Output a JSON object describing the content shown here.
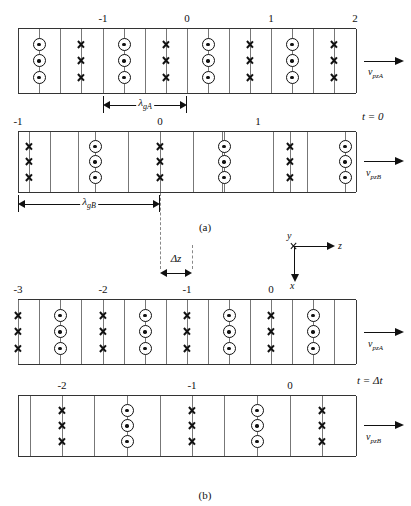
{
  "figure": {
    "title_a": "(a)",
    "title_b": "(b)",
    "caption_a_x": 205,
    "caption_a_y": 221,
    "caption_b_x": 205,
    "caption_b_y": 489
  },
  "axes_triad": {
    "y_label": "y",
    "z_label": "z",
    "x_label": "x",
    "origin_symbol": "cross"
  },
  "panels": [
    {
      "id": "panel-a-top",
      "name": "guide-A-t0",
      "left": 18,
      "top": 28,
      "width": 338,
      "height": 66,
      "tick_labels": [
        {
          "text": "-1",
          "x": 103
        },
        {
          "text": "0",
          "x": 187
        },
        {
          "text": "1",
          "x": 271
        },
        {
          "text": "2",
          "x": 355
        }
      ],
      "boundaries": [
        18,
        60,
        103,
        145,
        187,
        229,
        271,
        313,
        356
      ],
      "symbol_columns": [
        {
          "x": 39,
          "type": "dot"
        },
        {
          "x": 81,
          "type": "cross"
        },
        {
          "x": 124,
          "type": "dot"
        },
        {
          "x": 166,
          "type": "cross"
        },
        {
          "x": 208,
          "type": "dot"
        },
        {
          "x": 250,
          "type": "cross"
        },
        {
          "x": 292,
          "type": "dot"
        },
        {
          "x": 334,
          "type": "cross"
        }
      ],
      "velocity": {
        "label_v": "v",
        "label_sub": "pzA",
        "arrow_x": 364,
        "arrow_y": 56,
        "label_x": 368,
        "label_y": 66
      },
      "measure": {
        "label": "λ",
        "label_sub": "gA",
        "left": 103,
        "right": 187,
        "y": 100,
        "label_x": 145
      }
    },
    {
      "id": "panel-a-bottom",
      "name": "guide-B-t0",
      "left": 18,
      "top": 131,
      "width": 338,
      "height": 62,
      "tick_labels": [
        {
          "text": "-1",
          "x": 18
        },
        {
          "text": "0",
          "x": 160
        },
        {
          "text": "1",
          "x": 258
        }
      ],
      "boundaries": [
        18,
        50,
        78,
        128,
        160,
        193,
        222,
        273,
        307,
        356
      ],
      "symbol_columns": [
        {
          "x": 29,
          "type": "cross"
        },
        {
          "x": 95,
          "type": "dot"
        },
        {
          "x": 160,
          "type": "cross"
        },
        {
          "x": 224,
          "type": "dot"
        },
        {
          "x": 290,
          "type": "cross"
        },
        {
          "x": 345,
          "type": "dot"
        }
      ],
      "velocity": {
        "label_v": "v",
        "label_sub": "pzB",
        "arrow_x": 364,
        "arrow_y": 156,
        "label_x": 366,
        "label_y": 167
      },
      "time_label": {
        "text": "t = 0",
        "x": 362,
        "y": 110
      },
      "measure": {
        "label": "λ",
        "label_sub": "gB",
        "left": 18,
        "right": 160,
        "y": 199,
        "label_x": 89
      }
    },
    {
      "id": "panel-b-top",
      "name": "guide-A-tdt",
      "left": 18,
      "top": 299,
      "width": 338,
      "height": 66,
      "tick_labels": [
        {
          "text": "-3",
          "x": 18
        },
        {
          "text": "-2",
          "x": 103
        },
        {
          "text": "-1",
          "x": 187
        },
        {
          "text": "0",
          "x": 271
        }
      ],
      "boundaries": [
        18,
        39,
        81,
        124,
        166,
        208,
        250,
        292,
        334,
        356
      ],
      "symbol_columns": [
        {
          "x": 18,
          "type": "cross"
        },
        {
          "x": 60,
          "type": "dot"
        },
        {
          "x": 103,
          "type": "cross"
        },
        {
          "x": 145,
          "type": "dot"
        },
        {
          "x": 187,
          "type": "cross"
        },
        {
          "x": 229,
          "type": "dot"
        },
        {
          "x": 271,
          "type": "cross"
        },
        {
          "x": 313,
          "type": "dot"
        }
      ],
      "velocity": {
        "label_v": "v",
        "label_sub": "pzA",
        "arrow_x": 364,
        "arrow_y": 327,
        "label_x": 368,
        "label_y": 338
      }
    },
    {
      "id": "panel-b-bottom",
      "name": "guide-B-tdt",
      "left": 18,
      "top": 395,
      "width": 338,
      "height": 62,
      "tick_labels": [
        {
          "text": "-2",
          "x": 62
        },
        {
          "text": "-1",
          "x": 192
        },
        {
          "text": "0",
          "x": 290
        }
      ],
      "boundaries": [
        18,
        30,
        62,
        94,
        127,
        160,
        192,
        224,
        257,
        290,
        356
      ],
      "symbol_columns": [
        {
          "x": 62,
          "type": "cross"
        },
        {
          "x": 127,
          "type": "dot"
        },
        {
          "x": 192,
          "type": "cross"
        },
        {
          "x": 257,
          "type": "dot"
        },
        {
          "x": 322,
          "type": "cross"
        }
      ],
      "velocity": {
        "label_v": "v",
        "label_sub": "pzB",
        "arrow_x": 364,
        "arrow_y": 420,
        "label_x": 366,
        "label_y": 431
      },
      "time_label": {
        "text": "t = Δt",
        "x": 357,
        "y": 374
      }
    }
  ],
  "delta_z": {
    "label": "Δz",
    "left": 160,
    "right": 192,
    "y": 268,
    "label_x": 176,
    "label_y": 252
  },
  "dashed_guides": [
    {
      "x": 160,
      "top": 193,
      "height": 76
    },
    {
      "x": 192,
      "top": 245,
      "height": 24
    }
  ],
  "colors": {
    "ink": "#111111",
    "rule": "#333333",
    "inner_rule": "#777777",
    "background": "#ffffff"
  }
}
